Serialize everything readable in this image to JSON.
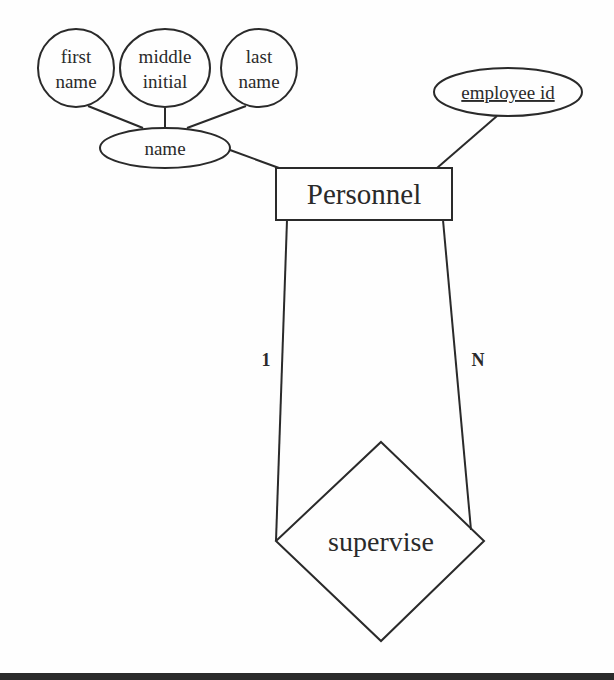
{
  "diagram": {
    "type": "ER diagram",
    "entity": {
      "name": "Personnel"
    },
    "relationship": {
      "name": "supervise",
      "cardinality_left": "1",
      "cardinality_right": "N"
    },
    "attributes": {
      "composite": {
        "name": "name",
        "parts": [
          {
            "line1": "first",
            "line2": "name"
          },
          {
            "line1": "middle",
            "line2": "initial"
          },
          {
            "line1": "last",
            "line2": "name"
          }
        ]
      },
      "key": {
        "name": "employee id"
      }
    },
    "colors": {
      "stroke": "#2a2a2a",
      "background": "#fefefe",
      "bottom_bar": "#2b2b2b"
    }
  }
}
